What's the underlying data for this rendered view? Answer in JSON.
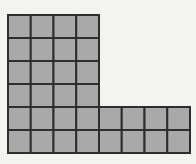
{
  "diagram": {
    "type": "grid-shape",
    "shape": "L-shaped polyomino of unit squares",
    "unit_squares_total": 32,
    "blocks": [
      {
        "name": "tall-block",
        "columns": 4,
        "rows": 6,
        "col_start": 0,
        "row_start": 0
      },
      {
        "name": "foot-block",
        "columns": 4,
        "rows": 2,
        "col_start": 4,
        "row_start": 4
      }
    ],
    "grid": {
      "total_columns": 8,
      "total_rows": 6,
      "origin_x": 8,
      "origin_y": 15,
      "cell_width": 22.75,
      "cell_height": 23
    },
    "colors": {
      "background": "#f3f3f2",
      "fill": "#a9a9a9",
      "line": "#2e2e2e"
    }
  }
}
